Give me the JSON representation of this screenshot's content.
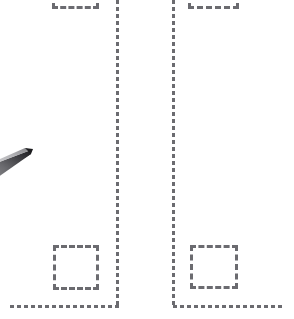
{
  "canvas": {
    "width": 294,
    "height": 319,
    "background_color": "#ffffff",
    "description": "Wireframe overlay view: two mirrored dashed L-shaped bounding guides with small dashed squares, and a dark pointer tip at left."
  },
  "style": {
    "guide_color": "#6b6b70",
    "stroke_width_px": 3,
    "dash_length_px": 4,
    "dash_gap_px": 3,
    "pointer_color_dark": "#2b2b2e",
    "pointer_color_mid": "#7a7a7e",
    "pointer_color_light": "#b9b9bd"
  },
  "groups": [
    {
      "name": "left-guide-group",
      "label": "Left dashed bounding guide",
      "vertical_rule": {
        "x": 116,
        "y": 0,
        "height": 308,
        "label": "Left vertical guide line"
      },
      "bottom_rule": {
        "x": 10,
        "y": 305,
        "width": 109,
        "label": "Left horizontal baseline guide"
      },
      "top_box": {
        "x": 52,
        "y": -18,
        "width": 47,
        "height": 27,
        "label": "Left top dashed box (clipped)"
      },
      "inner_box": {
        "x": 53,
        "y": 245,
        "width": 46,
        "height": 45,
        "label": "Left inner dashed square"
      }
    },
    {
      "name": "right-guide-group",
      "label": "Right dashed bounding guide",
      "vertical_rule": {
        "x": 172,
        "y": 0,
        "height": 308,
        "label": "Right vertical guide line"
      },
      "bottom_rule": {
        "x": 173,
        "y": 305,
        "width": 111,
        "label": "Right horizontal baseline guide"
      },
      "top_box": {
        "x": 188,
        "y": -18,
        "width": 51,
        "height": 27,
        "label": "Right top dashed box (clipped)"
      },
      "inner_box": {
        "x": 190,
        "y": 245,
        "width": 48,
        "height": 44,
        "label": "Right inner dashed square"
      }
    }
  ],
  "pointer": {
    "name": "pointer-tip",
    "label": "Stylus / pointer tip",
    "tip_x": 31,
    "tip_y": 152,
    "direction": "up-right"
  }
}
